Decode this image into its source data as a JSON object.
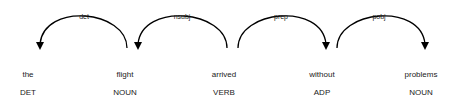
{
  "tokens": [
    {
      "text": "the",
      "tag": "DET",
      "x": 28
    },
    {
      "text": "flight",
      "tag": "NOUN",
      "x": 125
    },
    {
      "text": "arrived",
      "tag": "VERB",
      "x": 224
    },
    {
      "text": "without",
      "tag": "ADP",
      "x": 322
    },
    {
      "text": "problems",
      "tag": "NOUN",
      "x": 421
    }
  ],
  "arcs": [
    {
      "label": "det",
      "from": 1,
      "to": 0,
      "dir": "left",
      "x1": 40,
      "x2": 127
    },
    {
      "label": "nsubj",
      "from": 2,
      "to": 1,
      "dir": "left",
      "x1": 138,
      "x2": 227
    },
    {
      "label": "prep",
      "from": 2,
      "to": 3,
      "dir": "right",
      "x1": 238,
      "x2": 326
    },
    {
      "label": "pobj",
      "from": 3,
      "to": 4,
      "dir": "right",
      "x1": 337,
      "x2": 425
    }
  ],
  "colors": {
    "line": "#000000",
    "text": "#222222"
  }
}
